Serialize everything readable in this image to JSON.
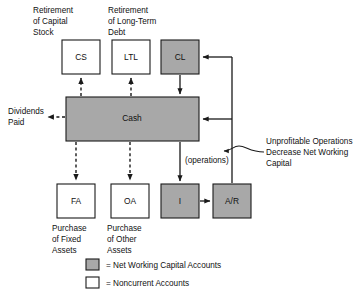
{
  "diagram": {
    "colors": {
      "net_working_capital_fill": "#a8a8a8",
      "noncurrent_fill": "#ffffff",
      "stroke": "#1a1a1a",
      "background": "#ffffff"
    },
    "boxes": [
      {
        "id": "cs",
        "label": "CS",
        "fill": "gray-no",
        "type": "noncurrent"
      },
      {
        "id": "ltl",
        "label": "LTL",
        "fill": "gray-no",
        "type": "noncurrent"
      },
      {
        "id": "cl",
        "label": "CL",
        "fill": "gray-yes",
        "type": "net-working-capital"
      },
      {
        "id": "cash",
        "label": "Cash",
        "fill": "gray-yes",
        "type": "net-working-capital"
      },
      {
        "id": "fa",
        "label": "FA",
        "fill": "gray-no",
        "type": "noncurrent"
      },
      {
        "id": "oa",
        "label": "OA",
        "fill": "gray-no",
        "type": "noncurrent"
      },
      {
        "id": "i",
        "label": "I",
        "fill": "gray-yes",
        "type": "net-working-capital"
      },
      {
        "id": "ar",
        "label": "A/R",
        "fill": "gray-yes",
        "type": "net-working-capital"
      }
    ],
    "captions": {
      "retirement_capital_stock": [
        "Retirement",
        "of Capital",
        "Stock"
      ],
      "retirement_long_term_debt": [
        "Retirement",
        "of Long-Term",
        "Debt"
      ],
      "dividends_paid": [
        "Dividends",
        "Paid"
      ],
      "purchase_fixed_assets": [
        "Purchase",
        "of Fixed",
        "Assets"
      ],
      "purchase_other_assets": [
        "Purchase",
        "of Other",
        "Assets"
      ],
      "operations": "(operations)",
      "unprofitable_note": [
        "Unprofitable Operations",
        "Decrease Net Working",
        "Capital"
      ]
    },
    "legend": [
      {
        "swatch": "gray",
        "text": "= Net Working Capital Accounts"
      },
      {
        "swatch": "white",
        "text": "= Noncurrent Accounts"
      }
    ]
  }
}
